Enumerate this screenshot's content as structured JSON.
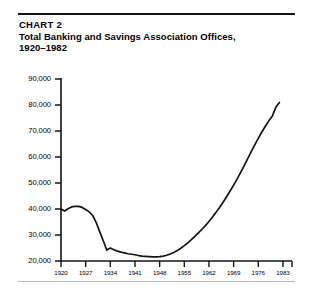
{
  "header": {
    "chart_number": "CHART 2",
    "title_line_1": "Total Banking and Savings Association Offices,",
    "title_line_2": "1920–1982"
  },
  "colors": {
    "ink": "#141414",
    "background": "#ffffff",
    "rule_bottom": "#b9b9b9"
  },
  "chart_data": {
    "type": "line",
    "title": "Total Banking and Savings Association Offices, 1920–1982",
    "subtitle": "CHART 2",
    "xlabel": "",
    "ylabel": "",
    "grid": false,
    "legend": null,
    "xlim": [
      1920,
      1985
    ],
    "ylim": [
      20000,
      90000
    ],
    "ytick_labels": [
      "90,000",
      "80,000",
      "70,000",
      "60,000",
      "50,000",
      "40,000",
      "30,000",
      "20,000"
    ],
    "yticks": [
      90000,
      80000,
      70000,
      60000,
      50000,
      40000,
      30000,
      20000
    ],
    "xtick_labels": [
      "1920",
      "1927",
      "1934",
      "1941",
      "1948",
      "1955",
      "1962",
      "1969",
      "1976",
      "1983"
    ],
    "xticks": [
      1920,
      1927,
      1934,
      1941,
      1948,
      1955,
      1962,
      1969,
      1976,
      1983
    ],
    "series": [
      {
        "name": "Total banking and savings association offices",
        "x": [
          1920,
          1921,
          1922,
          1923,
          1924,
          1925,
          1926,
          1927,
          1928,
          1929,
          1930,
          1931,
          1932,
          1933,
          1934,
          1935,
          1936,
          1937,
          1938,
          1939,
          1940,
          1941,
          1942,
          1943,
          1944,
          1945,
          1946,
          1947,
          1948,
          1949,
          1950,
          1951,
          1952,
          1953,
          1954,
          1955,
          1956,
          1957,
          1958,
          1959,
          1960,
          1961,
          1962,
          1963,
          1964,
          1965,
          1966,
          1967,
          1968,
          1969,
          1970,
          1971,
          1972,
          1973,
          1974,
          1975,
          1976,
          1977,
          1978,
          1979,
          1980,
          1981,
          1982
        ],
        "y": [
          40000,
          39200,
          40100,
          40800,
          41000,
          41000,
          40600,
          39800,
          38900,
          37500,
          34800,
          31200,
          27800,
          24200,
          25000,
          24300,
          23800,
          23400,
          23100,
          22800,
          22600,
          22400,
          22100,
          21900,
          21800,
          21700,
          21600,
          21600,
          21700,
          21900,
          22200,
          22700,
          23300,
          24000,
          24900,
          25900,
          27000,
          28200,
          29500,
          30800,
          32200,
          33600,
          35200,
          36900,
          38700,
          40600,
          42600,
          44700,
          46900,
          49200,
          51600,
          54100,
          56700,
          59400,
          62100,
          64700,
          67200,
          69600,
          71800,
          73900,
          75800,
          79200,
          81000
        ]
      }
    ],
    "annotations": [
      {
        "label": "peak",
        "x": 1924,
        "y": 41000
      },
      {
        "label": "trough",
        "x": 1946,
        "y": 21600
      },
      {
        "label": "end",
        "x": 1982,
        "y": 81000
      }
    ]
  }
}
